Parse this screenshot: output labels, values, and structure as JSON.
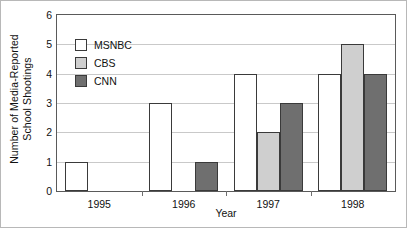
{
  "chart_data": {
    "type": "bar",
    "title": "",
    "subtitle": "",
    "xlabel": "Year",
    "ylabel": "Number of Media-Reported School Shootings",
    "ylabel_line1": "Number of Media-Reported",
    "ylabel_line2": "School Shootings",
    "categories": [
      "1995",
      "1996",
      "1997",
      "1998"
    ],
    "series": [
      {
        "name": "MSNBC",
        "values": [
          1,
          3,
          4,
          4
        ],
        "color": "#ffffff"
      },
      {
        "name": "CBS",
        "values": [
          0,
          0,
          2,
          5
        ],
        "color": "#cfcfcf"
      },
      {
        "name": "CNN",
        "values": [
          0,
          1,
          3,
          4
        ],
        "color": "#6f6f6f"
      }
    ],
    "ylim": [
      0,
      6
    ],
    "ytick_step": 1,
    "yticks": [
      "0",
      "1",
      "2",
      "3",
      "4",
      "5",
      "6"
    ],
    "grid": true,
    "grid_axis": "y",
    "legend_position": "upper-left-inside",
    "bar_edge_color": "#3a3a3a",
    "grid_color": "#c9c9c9",
    "axis_color": "#5a5a5a"
  }
}
